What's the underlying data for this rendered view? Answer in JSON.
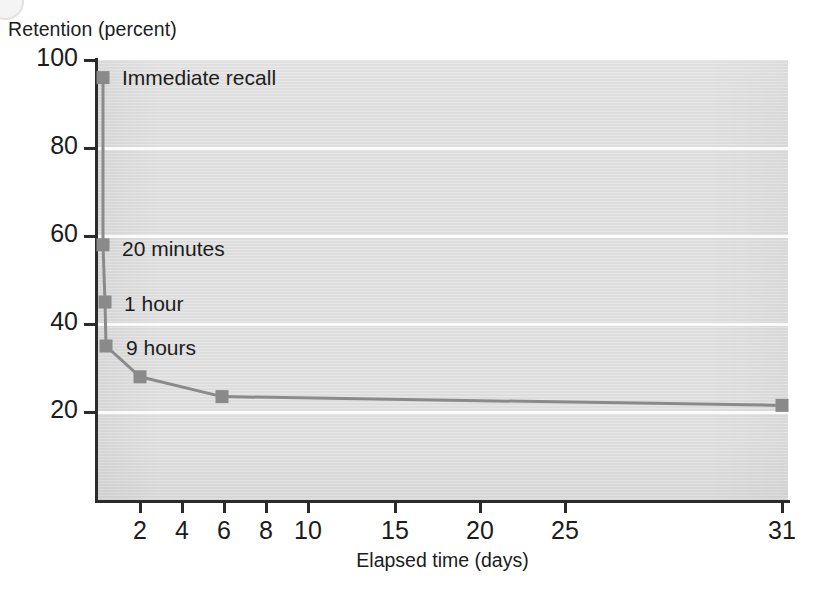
{
  "chart_data": {
    "type": "line",
    "title": "",
    "ylabel": "Retention (percent)",
    "xlabel": "Elapsed time (days)",
    "ylim": [
      0,
      100
    ],
    "xlim": [
      0,
      31
    ],
    "grid": "horizontal-white-gridlines",
    "legend": "none",
    "y_ticks": [
      {
        "value": 100,
        "label": "100"
      },
      {
        "value": 80,
        "label": "80"
      },
      {
        "value": 60,
        "label": "60"
      },
      {
        "value": 40,
        "label": "40"
      },
      {
        "value": 20,
        "label": "20"
      }
    ],
    "x_ticks": [
      {
        "value": 2,
        "label": "2",
        "px": 140
      },
      {
        "value": 4,
        "label": "4",
        "px": 182
      },
      {
        "value": 6,
        "label": "6",
        "px": 224
      },
      {
        "value": 8,
        "label": "8",
        "px": 266
      },
      {
        "value": 10,
        "label": "10",
        "px": 308
      },
      {
        "value": 15,
        "label": "15",
        "px": 395
      },
      {
        "value": 20,
        "label": "20",
        "px": 480
      },
      {
        "value": 25,
        "label": "25",
        "px": 565
      },
      {
        "value": 31,
        "label": "31",
        "px": 782
      }
    ],
    "series": [
      {
        "name": "Retention",
        "marker": "square",
        "color": "#8a8a8a",
        "line_color": "#8a8a8a",
        "points": [
          {
            "x_px": 103,
            "y_value": 96,
            "label": "Immediate recall"
          },
          {
            "x_px": 103,
            "y_value": 58,
            "label": "20 minutes"
          },
          {
            "x_px": 105,
            "y_value": 45,
            "label": "1 hour"
          },
          {
            "x_px": 106,
            "y_value": 35,
            "label": "9 hours"
          },
          {
            "x_px": 140,
            "y_value": 28,
            "label": ""
          },
          {
            "x_px": 222,
            "y_value": 23.5,
            "label": ""
          },
          {
            "x_px": 782,
            "y_value": 21.5,
            "label": ""
          }
        ]
      }
    ],
    "annotations": [
      {
        "text": "Immediate recall",
        "x_px": 122,
        "y_value": 96
      },
      {
        "text": "20 minutes",
        "x_px": 122,
        "y_value": 57
      },
      {
        "text": "1 hour",
        "x_px": 124,
        "y_value": 44.5
      },
      {
        "text": "9 hours",
        "x_px": 126,
        "y_value": 34.5
      }
    ]
  },
  "colors": {
    "plot_background": "#dddddd",
    "gridline": "#fbfbfb",
    "axis": "#2b2b2b",
    "series": "#8a8a8a",
    "text": "#1c1c1c",
    "page_background": "#ffffff"
  }
}
